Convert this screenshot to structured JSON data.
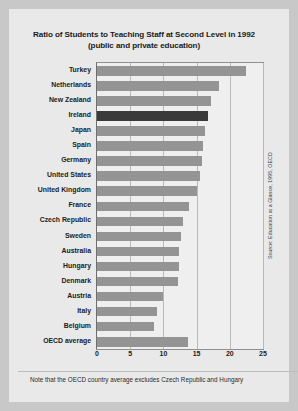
{
  "figure": {
    "title_line1": "Ratio of Students to Teaching Staff at Second Level in 1992",
    "title_line2": "(public and private education)",
    "footnote": "Note that the OECD country average excludes Czech Republic and Hungary",
    "source": "Source: Education at a Glance, 1995, OECD",
    "colors": {
      "background": "#e9e9e9",
      "page": "#c8c8c8",
      "bar": "#949494",
      "bar_highlight": "#3a3a3a",
      "grid": "#b9b9b9",
      "axis": "#8f8f8f",
      "text": "#1b1b1b"
    }
  },
  "chart_data": {
    "type": "bar",
    "orientation": "horizontal",
    "title": "Ratio of Students to Teaching Staff at Second Level in 1992 (public and private education)",
    "xlabel": "",
    "ylabel": "",
    "xlim": [
      0,
      25
    ],
    "xticks": [
      0,
      5,
      10,
      15,
      20,
      25
    ],
    "grid": true,
    "grid_axis": "x",
    "legend": null,
    "highlight_category": "Ireland",
    "categories": [
      "Turkey",
      "Netherlands",
      "New Zealand",
      "Ireland",
      "Japan",
      "Spain",
      "Germany",
      "United States",
      "United Kingdom",
      "France",
      "Czech Republic",
      "Sweden",
      "Australia",
      "Hungary",
      "Denmark",
      "Austria",
      "Italy",
      "Belgium",
      "OECD average"
    ],
    "values": [
      22.5,
      18.4,
      17.1,
      16.7,
      16.2,
      16.0,
      15.8,
      15.5,
      15.1,
      13.9,
      13.0,
      12.6,
      12.4,
      12.3,
      12.2,
      10.0,
      9.1,
      8.6,
      13.7
    ]
  }
}
